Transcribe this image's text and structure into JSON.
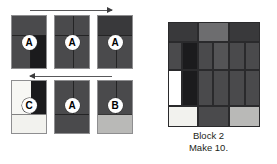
{
  "figure": {
    "background_color": "#ffffff"
  },
  "palette": {
    "dark_charcoal": "#39393b",
    "black": "#1b1b1d",
    "medium_gray": "#6d6d6f",
    "mid_dark_gray": "#4a4a4c",
    "light_gray": "#b9b9b7",
    "off_white": "#f2f2ee",
    "white": "#ffffff",
    "block_background": "#d8d8d6",
    "outline": "#2a2a2c",
    "caption_color": "#231f20"
  },
  "assembly": {
    "name": "assembly-sequence",
    "rows": [
      {
        "row_name": "top-row",
        "arrow": {
          "name": "arrow-right",
          "direction": "right",
          "label": ""
        },
        "units": [
          {
            "name": "unit-a-1",
            "letter": "A",
            "patches": [
              {
                "name": "top-band",
                "color": "#4a4a4c",
                "x": 0,
                "y": 0,
                "w": 36,
                "h": 19
              },
              {
                "name": "bottom-left",
                "color": "#4a4a4c",
                "x": 0,
                "y": 19,
                "w": 18,
                "h": 35
              },
              {
                "name": "bottom-right",
                "color": "#1b1b1d",
                "x": 18,
                "y": 19,
                "w": 18,
                "h": 35
              }
            ]
          },
          {
            "name": "unit-a-2",
            "letter": "A",
            "patches": [
              {
                "name": "top-band",
                "color": "#4a4a4c",
                "x": 0,
                "y": 0,
                "w": 36,
                "h": 19
              },
              {
                "name": "bottom-left",
                "color": "#4a4a4c",
                "x": 0,
                "y": 19,
                "w": 18,
                "h": 35
              },
              {
                "name": "bottom-right",
                "color": "#4a4a4c",
                "x": 18,
                "y": 19,
                "w": 18,
                "h": 35
              }
            ]
          },
          {
            "name": "unit-a-3",
            "letter": "A",
            "patches": [
              {
                "name": "top-band",
                "color": "#39393b",
                "x": 0,
                "y": 0,
                "w": 36,
                "h": 19
              },
              {
                "name": "bottom-left",
                "color": "#4a4a4c",
                "x": 0,
                "y": 19,
                "w": 18,
                "h": 35
              },
              {
                "name": "bottom-right",
                "color": "#4a4a4c",
                "x": 18,
                "y": 19,
                "w": 18,
                "h": 35
              }
            ]
          }
        ]
      },
      {
        "row_name": "bottom-row",
        "arrow": {
          "name": "arrow-left",
          "direction": "left",
          "label": ""
        },
        "units": [
          {
            "name": "unit-c",
            "letter": "C",
            "patches": [
              {
                "name": "top-left-white",
                "color": "#f7f7f4",
                "x": 0,
                "y": 0,
                "w": 19,
                "h": 33
              },
              {
                "name": "top-right-black",
                "color": "#1b1b1d",
                "x": 19,
                "y": 0,
                "w": 17,
                "h": 33
              },
              {
                "name": "bottom-band",
                "color": "#f2f2ee",
                "x": 0,
                "y": 33,
                "w": 36,
                "h": 21
              }
            ]
          },
          {
            "name": "unit-a-4",
            "letter": "A",
            "patches": [
              {
                "name": "top-left",
                "color": "#4a4a4c",
                "x": 0,
                "y": 0,
                "w": 18,
                "h": 33
              },
              {
                "name": "top-right",
                "color": "#4a4a4c",
                "x": 18,
                "y": 0,
                "w": 18,
                "h": 33
              },
              {
                "name": "bottom-band",
                "color": "#4a4a4c",
                "x": 0,
                "y": 33,
                "w": 36,
                "h": 21
              }
            ]
          },
          {
            "name": "unit-b",
            "letter": "B",
            "patches": [
              {
                "name": "top-left",
                "color": "#4a4a4c",
                "x": 0,
                "y": 0,
                "w": 18,
                "h": 33
              },
              {
                "name": "top-right",
                "color": "#4a4a4c",
                "x": 18,
                "y": 0,
                "w": 18,
                "h": 33
              },
              {
                "name": "bottom-band",
                "color": "#b9b9b7",
                "x": 0,
                "y": 33,
                "w": 36,
                "h": 21
              }
            ]
          }
        ]
      }
    ]
  },
  "block": {
    "name": "finished-block",
    "caption_title": "Block 2",
    "caption_count": "Make 10.",
    "patches": [
      {
        "name": "top-left-dark",
        "color": "#39393b",
        "x": 0,
        "y": 0,
        "w": 30,
        "h": 20
      },
      {
        "name": "top-center-medium",
        "color": "#6d6d6f",
        "x": 30,
        "y": 0,
        "w": 31,
        "h": 20
      },
      {
        "name": "top-right-dark",
        "color": "#39393b",
        "x": 61,
        "y": 0,
        "w": 31,
        "h": 20
      },
      {
        "name": "mid-bar-1",
        "color": "#4a4a4c",
        "x": 0,
        "y": 20,
        "w": 14,
        "h": 45
      },
      {
        "name": "mid-bar-black",
        "color": "#1b1b1d",
        "x": 14,
        "y": 20,
        "w": 16,
        "h": 45
      },
      {
        "name": "mid-bar-3",
        "color": "#4a4a4c",
        "x": 30,
        "y": 20,
        "w": 15,
        "h": 45
      },
      {
        "name": "mid-bar-4",
        "color": "#55555700",
        "x": 45,
        "y": 20,
        "w": 16,
        "h": 45
      },
      {
        "name": "mid-bar-5",
        "color": "#4a4a4c",
        "x": 61,
        "y": 20,
        "w": 16,
        "h": 45
      },
      {
        "name": "mid-bar-6",
        "color": "#4a4a4c",
        "x": 77,
        "y": 20,
        "w": 15,
        "h": 45
      },
      {
        "name": "lower-left-white",
        "color": "#ffffff",
        "x": 0,
        "y": 48,
        "w": 14,
        "h": 36
      },
      {
        "name": "lower-bar-black",
        "color": "#1b1b1d",
        "x": 14,
        "y": 48,
        "w": 16,
        "h": 36
      },
      {
        "name": "lower-bar-3",
        "color": "#4a4a4c",
        "x": 30,
        "y": 48,
        "w": 15,
        "h": 36
      },
      {
        "name": "lower-bar-4",
        "color": "#4a4a4c",
        "x": 45,
        "y": 48,
        "w": 16,
        "h": 36
      },
      {
        "name": "lower-bar-5",
        "color": "#4a4a4c",
        "x": 61,
        "y": 48,
        "w": 16,
        "h": 36
      },
      {
        "name": "lower-bar-6",
        "color": "#4a4a4c",
        "x": 77,
        "y": 48,
        "w": 15,
        "h": 36
      },
      {
        "name": "bottom-left-offwhite",
        "color": "#f2f2ee",
        "x": 0,
        "y": 84,
        "w": 30,
        "h": 21
      },
      {
        "name": "bottom-center-dark",
        "color": "#4a4a4c",
        "x": 30,
        "y": 84,
        "w": 31,
        "h": 21
      },
      {
        "name": "bottom-right-light",
        "color": "#b9b9b7",
        "x": 61,
        "y": 84,
        "w": 31,
        "h": 21
      }
    ]
  }
}
